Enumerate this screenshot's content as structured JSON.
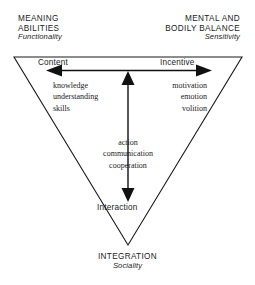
{
  "diagram": {
    "shape": "inverted-triangle",
    "line_color": "#1a1a1a",
    "background": "#ffffff",
    "corners": {
      "left": {
        "heading_line1": "MEANING",
        "heading_line2": "ABILITIES",
        "subtitle": "Functionality"
      },
      "right": {
        "heading_line1": "MENTAL AND",
        "heading_line2": "BODILY BALANCE",
        "subtitle": "Sensitivity"
      },
      "bottom": {
        "heading_line1": "INTEGRATION",
        "subtitle": "Sociality"
      }
    },
    "axes": {
      "horizontal_left_label": "Content",
      "horizontal_right_label": "Incentive",
      "vertical_bottom_label": "Interaction"
    },
    "word_groups": {
      "left": [
        "knowledge",
        "understanding",
        "skills"
      ],
      "right": [
        "motivation",
        "emotion",
        "volition"
      ],
      "center": [
        "action",
        "communication",
        "cooperation"
      ]
    }
  }
}
